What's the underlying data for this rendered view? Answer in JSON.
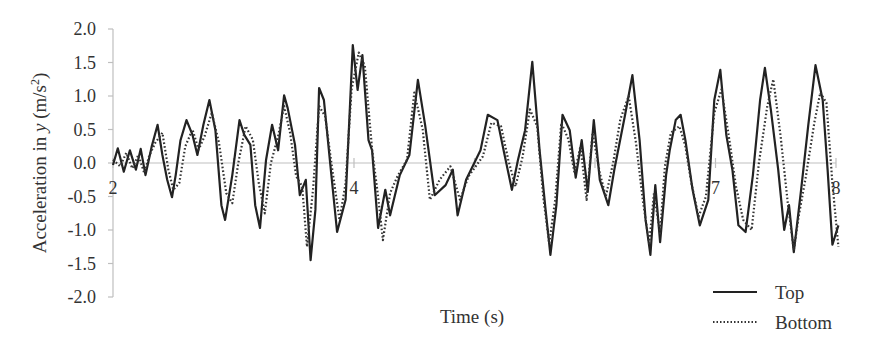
{
  "chart_data": {
    "type": "line",
    "title": "",
    "xlabel": "Time (s)",
    "ylabel": "Acceleration in y (m/s²)",
    "ylabel_parts": {
      "prefix": "Acceleration in ",
      "var": "y",
      "unit": " (m/s",
      "sup": "2",
      "close": ")"
    },
    "xlim": [
      2,
      8
    ],
    "ylim": [
      -2.0,
      2.0
    ],
    "x_tick_labels": [
      {
        "value": 2,
        "label": "2"
      },
      {
        "value": 4,
        "label": "4"
      },
      {
        "value": 7,
        "label": "7"
      },
      {
        "value": 8,
        "label": "8"
      }
    ],
    "x_ticks": [
      2,
      3,
      4,
      5,
      6,
      7,
      8
    ],
    "y_ticks": [
      {
        "value": 2.0,
        "label": "2.0"
      },
      {
        "value": 1.5,
        "label": "1.5"
      },
      {
        "value": 1.0,
        "label": "1.0"
      },
      {
        "value": 0.5,
        "label": "0.5"
      },
      {
        "value": 0.0,
        "label": "0.0"
      },
      {
        "value": -0.5,
        "label": "-0.5"
      },
      {
        "value": -1.0,
        "label": "-1.0"
      },
      {
        "value": -1.5,
        "label": "-1.5"
      },
      {
        "value": -2.0,
        "label": "-2.0"
      }
    ],
    "grid": false,
    "legend_position": "bottom-right",
    "series": [
      {
        "name": "Top",
        "style": "solid",
        "color": "#222222",
        "x": [
          2.0,
          2.04,
          2.09,
          2.14,
          2.19,
          2.23,
          2.27,
          2.32,
          2.37,
          2.41,
          2.45,
          2.49,
          2.52,
          2.56,
          2.61,
          2.66,
          2.7,
          2.75,
          2.8,
          2.85,
          2.9,
          2.93,
          2.99,
          3.05,
          3.09,
          3.14,
          3.18,
          3.22,
          3.27,
          3.32,
          3.37,
          3.42,
          3.45,
          3.51,
          3.55,
          3.6,
          3.64,
          3.68,
          3.71,
          3.75,
          3.8,
          3.86,
          3.93,
          3.99,
          4.03,
          4.07,
          4.12,
          4.15,
          4.2,
          4.26,
          4.3,
          4.38,
          4.46,
          4.53,
          4.59,
          4.67,
          4.76,
          4.82,
          4.86,
          4.93,
          5.05,
          5.11,
          5.19,
          5.25,
          5.31,
          5.36,
          5.42,
          5.48,
          5.54,
          5.59,
          5.63,
          5.68,
          5.73,
          5.79,
          5.84,
          5.89,
          5.94,
          5.99,
          6.04,
          6.11,
          6.16,
          6.25,
          6.31,
          6.37,
          6.42,
          6.46,
          6.5,
          6.54,
          6.59,
          6.62,
          6.67,
          6.71,
          6.75,
          6.81,
          6.87,
          6.94,
          6.99,
          7.04,
          7.09,
          7.14,
          7.19,
          7.25,
          7.31,
          7.37,
          7.41,
          7.46,
          7.52,
          7.57,
          7.61,
          7.65,
          7.71,
          7.77,
          7.83,
          7.89,
          7.93,
          7.97,
          8.02
        ],
        "values": [
          -0.03,
          0.22,
          -0.13,
          0.19,
          -0.1,
          0.21,
          -0.18,
          0.24,
          0.57,
          0.12,
          -0.25,
          -0.51,
          -0.18,
          0.34,
          0.64,
          0.42,
          0.12,
          0.57,
          0.94,
          0.49,
          -0.63,
          -0.85,
          -0.18,
          0.64,
          0.42,
          0.27,
          -0.63,
          -0.97,
          0.04,
          0.57,
          0.19,
          1.01,
          0.82,
          0.27,
          -0.48,
          -0.25,
          -1.45,
          -0.7,
          1.12,
          0.94,
          0.04,
          -1.03,
          -0.55,
          1.76,
          1.09,
          1.61,
          0.34,
          0.19,
          -0.97,
          -0.4,
          -0.78,
          -0.18,
          0.12,
          1.24,
          0.57,
          -0.48,
          -0.33,
          -0.1,
          -0.78,
          -0.25,
          0.19,
          0.72,
          0.64,
          0.12,
          -0.4,
          0.04,
          0.49,
          1.51,
          0.19,
          -0.7,
          -1.37,
          -0.63,
          0.72,
          0.49,
          -0.22,
          0.34,
          -0.43,
          0.64,
          -0.25,
          -0.63,
          -0.1,
          0.72,
          1.31,
          0.34,
          -0.85,
          -1.37,
          -0.33,
          -1.18,
          -0.18,
          0.19,
          0.64,
          0.72,
          0.34,
          -0.4,
          -0.93,
          -0.55,
          0.94,
          1.39,
          0.42,
          -0.1,
          -0.93,
          -1.03,
          -0.18,
          0.94,
          1.42,
          0.79,
          -0.1,
          -1.0,
          -0.63,
          -1.33,
          -0.4,
          0.57,
          1.46,
          0.94,
          -0.1,
          -1.22,
          -0.93
        ]
      },
      {
        "name": "Bottom",
        "style": "dotted",
        "color": "#333333",
        "x": [
          2.0,
          2.06,
          2.11,
          2.16,
          2.21,
          2.26,
          2.3,
          2.35,
          2.41,
          2.46,
          2.5,
          2.55,
          2.6,
          2.66,
          2.71,
          2.76,
          2.82,
          2.88,
          2.94,
          2.99,
          3.04,
          3.1,
          3.16,
          3.21,
          3.26,
          3.31,
          3.37,
          3.42,
          3.47,
          3.52,
          3.57,
          3.61,
          3.66,
          3.71,
          3.76,
          3.82,
          3.88,
          3.93,
          3.98,
          4.04,
          4.09,
          4.15,
          4.2,
          4.24,
          4.3,
          4.36,
          4.44,
          4.5,
          4.57,
          4.63,
          4.71,
          4.8,
          4.88,
          4.95,
          5.07,
          5.14,
          5.22,
          5.28,
          5.34,
          5.4,
          5.46,
          5.52,
          5.57,
          5.62,
          5.67,
          5.72,
          5.78,
          5.83,
          5.88,
          5.93,
          5.98,
          6.04,
          6.09,
          6.15,
          6.21,
          6.28,
          6.34,
          6.4,
          6.45,
          6.49,
          6.54,
          6.58,
          6.63,
          6.7,
          6.75,
          6.8,
          6.86,
          6.92,
          6.99,
          7.05,
          7.11,
          7.17,
          7.23,
          7.3,
          7.36,
          7.43,
          7.48,
          7.54,
          7.6,
          7.65,
          7.69,
          7.75,
          7.82,
          7.87,
          7.92,
          7.97,
          8.02
        ],
        "values": [
          0.05,
          -0.05,
          0.15,
          -0.08,
          0.12,
          -0.15,
          0.1,
          0.3,
          0.45,
          -0.1,
          -0.4,
          -0.3,
          0.25,
          0.5,
          0.2,
          0.4,
          0.75,
          0.3,
          -0.45,
          -0.6,
          0.0,
          0.55,
          0.35,
          -0.3,
          -0.75,
          0.0,
          0.4,
          0.85,
          0.45,
          -0.2,
          -0.35,
          -1.25,
          -0.4,
          0.85,
          0.7,
          -0.1,
          -0.85,
          -0.3,
          1.1,
          1.65,
          1.45,
          0.2,
          -0.5,
          -1.15,
          -0.45,
          -0.2,
          0.05,
          1.05,
          0.5,
          -0.55,
          -0.25,
          -0.05,
          -0.55,
          -0.2,
          0.1,
          0.6,
          0.55,
          0.05,
          -0.35,
          0.1,
          0.8,
          0.55,
          -0.5,
          -1.2,
          -0.55,
          0.6,
          0.35,
          -0.15,
          0.25,
          -0.55,
          0.45,
          -0.15,
          -0.5,
          0.0,
          0.65,
          1.0,
          0.3,
          -0.6,
          -1.2,
          -0.45,
          -1.05,
          -0.05,
          0.45,
          0.55,
          0.25,
          -0.3,
          -0.8,
          -0.5,
          0.75,
          1.1,
          0.4,
          -0.35,
          -0.85,
          -1.0,
          0.0,
          0.85,
          1.25,
          0.4,
          -0.6,
          -1.3,
          -0.8,
          -0.2,
          0.6,
          1.05,
          0.9,
          -0.3,
          -1.25
        ]
      }
    ]
  },
  "legend": {
    "items": [
      {
        "label": "Top",
        "style": "solid"
      },
      {
        "label": "Bottom",
        "style": "dotted"
      }
    ]
  },
  "colors": {
    "axis": "#bfbfbf",
    "text": "#333333",
    "top_line": "#222222",
    "bottom_line": "#333333"
  }
}
